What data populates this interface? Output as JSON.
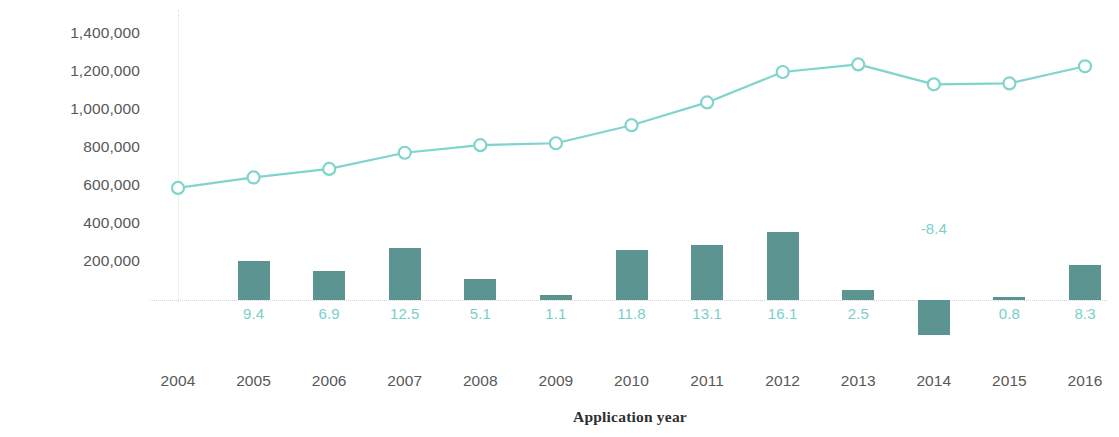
{
  "chart_data": {
    "type": "line",
    "title": "",
    "subtitle": "",
    "xlabel": "Application year",
    "ylabel": "Application design count",
    "grid": false,
    "legend_position": "none",
    "categories": [
      "2004",
      "2005",
      "2006",
      "2007",
      "2008",
      "2009",
      "2010",
      "2011",
      "2012",
      "2013",
      "2014",
      "2015",
      "2016"
    ],
    "x": [
      2004,
      2005,
      2006,
      2007,
      2008,
      2009,
      2010,
      2011,
      2012,
      2013,
      2014,
      2015,
      2016
    ],
    "ylim": [
      0,
      1400000
    ],
    "yticks": [
      1400000,
      1200000,
      1000000,
      800000,
      600000,
      400000,
      200000
    ],
    "ytick_labels": [
      "1,400,000",
      "1,200,000",
      "1,000,000",
      "800,000",
      "600,000",
      "400,000",
      "200,000"
    ],
    "series": [
      {
        "name": "Application design count",
        "type": "line",
        "marker": "open-circle",
        "color": "#7fd4cd",
        "values": [
          590000,
          645000,
          690000,
          775000,
          815000,
          825000,
          920000,
          1040000,
          1200000,
          1240000,
          1135000,
          1140000,
          1230000
        ]
      },
      {
        "name": "Growth rate (%)",
        "type": "bar",
        "color": "#5b9490",
        "label_color": "#79cfc9",
        "unit": "%",
        "values": [
          null,
          9.4,
          6.9,
          12.5,
          5.1,
          1.1,
          11.8,
          13.1,
          16.1,
          2.5,
          -8.4,
          0.8,
          8.3
        ],
        "data_labels": [
          "",
          "9.4",
          "6.9",
          "12.5",
          "5.1",
          "1.1",
          "11.8",
          "13.1",
          "16.1",
          "2.5",
          "-8.4",
          "0.8",
          "8.3"
        ]
      }
    ],
    "colors": {
      "line": "#7fd4cd",
      "bar": "#5b9490",
      "bar_label": "#79cfc9",
      "axis_text": "#58585a",
      "axis_title": "#2f2f2f",
      "baseline": "#d8d8d8",
      "background": "#ffffff"
    }
  }
}
